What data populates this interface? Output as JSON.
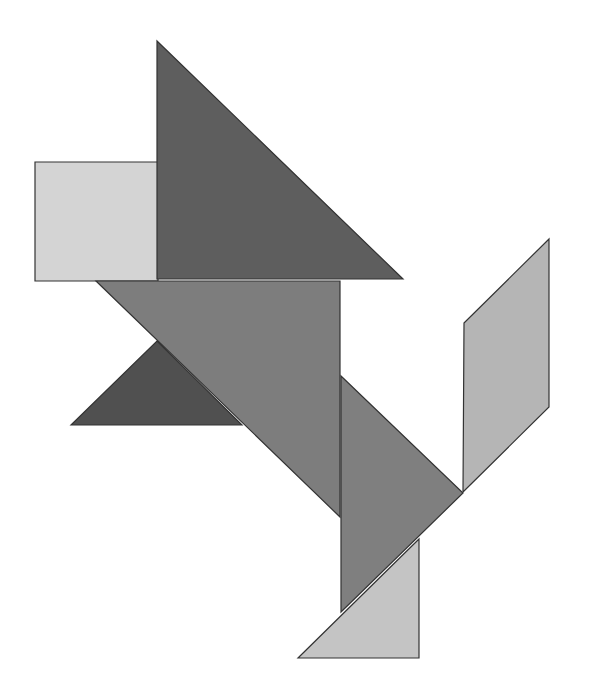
{
  "figure": {
    "width": 591,
    "height": 692,
    "background": "#ffffff",
    "pieces": [
      {
        "id": "square",
        "name": "square-piece",
        "fill": "#d4d4d4",
        "points": "35,162 158,162 158,281 35,281"
      },
      {
        "id": "large-triangle-top",
        "name": "large-triangle-top-piece",
        "fill": "#5e5e5e",
        "points": "157,41 403,279 157,279"
      },
      {
        "id": "large-triangle-middle",
        "name": "large-triangle-middle-piece",
        "fill": "#7d7d7d",
        "points": "96,281 340,281 340,517"
      },
      {
        "id": "small-triangle-dark",
        "name": "small-triangle-dark-piece",
        "fill": "#505050",
        "points": "71,425 157,341 242,425"
      },
      {
        "id": "medium-triangle",
        "name": "medium-triangle-piece",
        "fill": "#7f7f7f",
        "points": "341,376 463,493 341,612"
      },
      {
        "id": "parallelogram",
        "name": "parallelogram-piece",
        "fill": "#b5b5b5",
        "points": "464,323 549,239 549,407 463,492"
      },
      {
        "id": "small-triangle-light",
        "name": "small-triangle-light-piece",
        "fill": "#c4c4c4",
        "points": "298,658 419,539 419,658"
      }
    ]
  }
}
